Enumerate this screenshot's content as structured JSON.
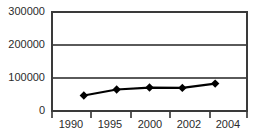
{
  "chart_data": {
    "type": "line",
    "title": "",
    "subtitle": "",
    "xlabel": "",
    "ylabel": "",
    "categories": [
      "1990",
      "1995",
      "2000",
      "2002",
      "2004"
    ],
    "values": [
      44000,
      62000,
      68000,
      67000,
      80000
    ],
    "series": [
      {
        "name": "",
        "values": [
          44000,
          62000,
          68000,
          67000,
          80000
        ]
      }
    ],
    "ylim": [
      0,
      300000
    ],
    "yticks": [
      0,
      100000,
      200000,
      300000
    ],
    "ytick_labels": [
      "0",
      "100000",
      "200000",
      "300000"
    ],
    "grid": true,
    "grid_axis": "y",
    "legend": false,
    "legend_position": "none",
    "marker": "diamond",
    "line_color": "#000000",
    "marker_color": "#000000",
    "grid_color": "#5a5a5a",
    "frame_color": "#3a3a3a",
    "background_color": "#ffffff"
  },
  "axes": {
    "y_labels": [
      {
        "text": "300000",
        "value": 300000
      },
      {
        "text": "200000",
        "value": 200000
      },
      {
        "text": "100000",
        "value": 100000
      },
      {
        "text": "0",
        "value": 0
      }
    ],
    "x_labels": [
      {
        "text": "1990"
      },
      {
        "text": "1995"
      },
      {
        "text": "2000"
      },
      {
        "text": "2002"
      },
      {
        "text": "2004"
      }
    ]
  }
}
